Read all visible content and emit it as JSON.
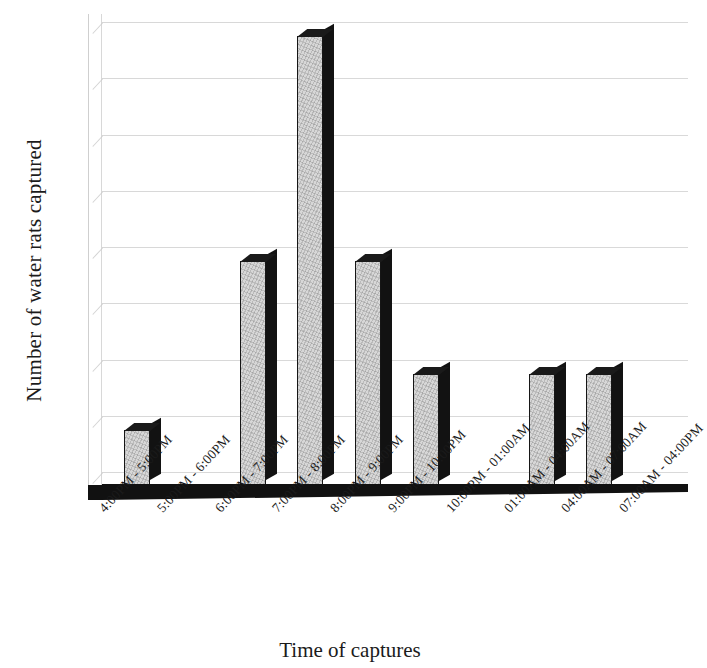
{
  "chart_data": {
    "type": "bar",
    "title": "",
    "xlabel": "Time of captures",
    "ylabel": "Number of water rats captured",
    "categories": [
      "4:00PM - 5:00PM",
      "5:00PM - 6:00PM",
      "6:00PM - 7:00PM",
      "7:00PM - 8:00PM",
      "8:00PM - 9:00PM",
      "9:00PM - 10:00PM",
      "10:00PM - 01:00AM",
      "01:00AM - 04:00AM",
      "04:00AM - 07:00AM",
      "07:00AM - 04:00PM"
    ],
    "values": [
      1,
      0,
      4,
      8,
      4,
      2,
      0,
      2,
      2,
      0
    ],
    "ylim": [
      0,
      8
    ],
    "yticks": [
      0,
      1,
      2,
      3,
      4,
      5,
      6,
      7,
      8
    ],
    "ytick_labels": [
      "0",
      "1",
      "2",
      "3",
      "4",
      "5",
      "6",
      "7",
      "8"
    ],
    "grid": true,
    "legend": false,
    "style": "3d-column",
    "bar_face_color": "#d7d7d7",
    "bar_edge_color": "#121212",
    "grid_color": "#d2d2d2",
    "background_color": "#ffffff"
  }
}
